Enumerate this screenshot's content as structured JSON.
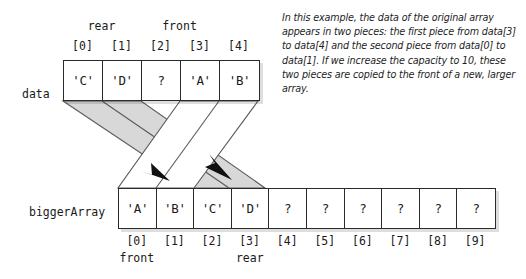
{
  "figure": {
    "caption": "In this example, the data of the original array appears in two pieces: the first piece from data[3] to data[4] and the second piece from data[0] to data[1]. If we increase the capacity to 10, these two pieces are copied to the front of a new, larger array."
  },
  "colors": {
    "outline": "#2b2b2b",
    "band_fill": "#d8d8d8",
    "band_stroke": "#5a5a5a",
    "shadow": "#d4d4d4",
    "text": "#1a1a1a",
    "cell_bg": "#ffffff"
  },
  "top_array": {
    "name": "data",
    "capacity": 5,
    "cells": [
      "'C'",
      "'D'",
      "?",
      "'A'",
      "'B'"
    ],
    "indices": [
      "[0]",
      "[1]",
      "[2]",
      "[3]",
      "[4]"
    ],
    "pointers": {
      "rear_label": "rear",
      "rear_index": 1,
      "front_label": "front",
      "front_index": 3
    }
  },
  "bottom_array": {
    "name": "biggerArray",
    "capacity": 10,
    "cells": [
      "'A'",
      "'B'",
      "'C'",
      "'D'",
      "?",
      "?",
      "?",
      "?",
      "?",
      "?"
    ],
    "indices": [
      "[0]",
      "[1]",
      "[2]",
      "[3]",
      "[4]",
      "[5]",
      "[6]",
      "[7]",
      "[8]",
      "[9]"
    ],
    "pointers": {
      "front_label": "front",
      "front_index": 0,
      "rear_label": "rear",
      "rear_index": 3
    }
  },
  "copy_bands": [
    {
      "id": "front-piece",
      "style": "white",
      "from_cells": "data[3]-data[4]",
      "to_cells": "biggerArray[0]-biggerArray[1]"
    },
    {
      "id": "rear-piece",
      "style": "gray",
      "from_cells": "data[0]-data[1]",
      "to_cells": "biggerArray[2]-biggerArray[3]"
    }
  ]
}
